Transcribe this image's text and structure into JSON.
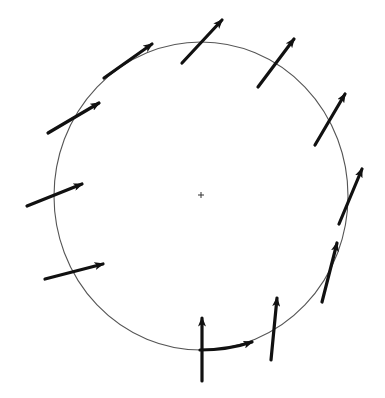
{
  "diagram": {
    "type": "vector-field-on-circle",
    "width": 385,
    "height": 398,
    "background": "#ffffff",
    "circle": {
      "cx": 201,
      "cy": 196,
      "rx": 147,
      "ry": 154,
      "stroke": "#555555",
      "stroke_width": 1.1
    },
    "center_marker": {
      "x": 201,
      "y": 195,
      "size": 3,
      "stroke": "#333333"
    },
    "arrow_color": "#111111",
    "arrows": [
      {
        "id": "a1",
        "x1": 104,
        "y1": 78,
        "x2": 152,
        "y2": 44,
        "label": ""
      },
      {
        "id": "a2",
        "x1": 182,
        "y1": 63,
        "x2": 222,
        "y2": 20,
        "label": ""
      },
      {
        "id": "a3",
        "x1": 258,
        "y1": 87,
        "x2": 294,
        "y2": 39,
        "label": ""
      },
      {
        "id": "a4",
        "x1": 315,
        "y1": 145,
        "x2": 345,
        "y2": 94,
        "label": ""
      },
      {
        "id": "a5",
        "x1": 339,
        "y1": 224,
        "x2": 362,
        "y2": 169,
        "label": ""
      },
      {
        "id": "a6",
        "x1": 322,
        "y1": 302,
        "x2": 337,
        "y2": 243,
        "label": ""
      },
      {
        "id": "a7",
        "x1": 271,
        "y1": 360,
        "x2": 277,
        "y2": 298,
        "label": ""
      },
      {
        "id": "a8",
        "x1": 202,
        "y1": 381,
        "x2": 202,
        "y2": 318,
        "label": ""
      },
      {
        "id": "a9",
        "x1": 200,
        "y1": 350,
        "x2": 252,
        "y2": 342,
        "label": "",
        "curved": true,
        "cx": 228,
        "cy": 350
      },
      {
        "id": "a10",
        "x1": 45,
        "y1": 279,
        "x2": 103,
        "y2": 264,
        "label": ""
      },
      {
        "id": "a11",
        "x1": 27,
        "y1": 206,
        "x2": 82,
        "y2": 184,
        "label": ""
      },
      {
        "id": "a12",
        "x1": 48,
        "y1": 133,
        "x2": 99,
        "y2": 103,
        "label": ""
      }
    ]
  }
}
